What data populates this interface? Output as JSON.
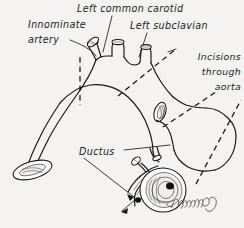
{
  "figure": {
    "background_color": "#f4f3f1",
    "ink_color": "#161616",
    "style": "pen-and-ink anatomical line drawing"
  },
  "labels": {
    "innominate_line1": "Innominate",
    "innominate_line2": "artery",
    "left_common_carotid": "Left common carotid",
    "left_subclavian": "Left subclavian",
    "incisions_line1": "Incisions",
    "incisions_line2": "through",
    "incisions_line3": "aorta",
    "ductus": "Ductus"
  },
  "signature": {
    "text": "Drummond"
  },
  "annotations": {
    "dashed_line_meaning": "incision through aorta",
    "arrow_target": "ductus orifice"
  }
}
